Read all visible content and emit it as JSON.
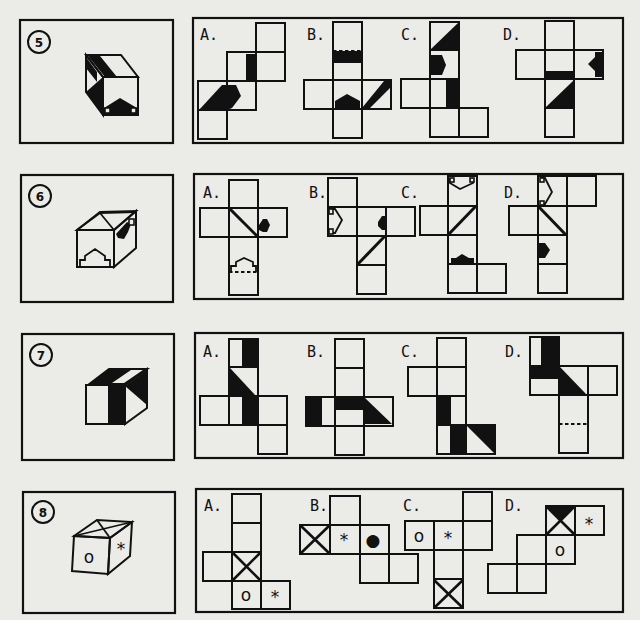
{
  "page": {
    "type": "cube-net-puzzle-sheet",
    "background": "#ebebe8",
    "ink": "#111111"
  },
  "problems": [
    {
      "number": "5",
      "cube": {
        "description": "cube with black diagonal stripe on top/left, black arrow pointing up on front face"
      },
      "options": [
        {
          "label": "A."
        },
        {
          "label": "B."
        },
        {
          "label": "C."
        },
        {
          "label": "D."
        }
      ]
    },
    {
      "number": "6",
      "cube": {
        "description": "cube with white house/arrow on front, triangle roof lines on top, black arrow on right face"
      },
      "options": [
        {
          "label": "A."
        },
        {
          "label": "B."
        },
        {
          "label": "C."
        },
        {
          "label": "D."
        }
      ]
    },
    {
      "number": "7",
      "cube": {
        "description": "cube with black top and vertical stripe on front, black triangle on right face"
      },
      "options": [
        {
          "label": "A."
        },
        {
          "label": "B."
        },
        {
          "label": "C."
        },
        {
          "label": "D."
        }
      ]
    },
    {
      "number": "8",
      "cube": {
        "description": "cube with X on top, circle on front, asterisk on right",
        "symbols": {
          "front": "o",
          "right": "*"
        }
      },
      "options": [
        {
          "label": "A.",
          "symbols": [
            "o",
            "*"
          ]
        },
        {
          "label": "B.",
          "symbols": [
            "*",
            "●"
          ]
        },
        {
          "label": "C.",
          "symbols": [
            "o",
            "*"
          ]
        },
        {
          "label": "D.",
          "symbols": [
            "*",
            "o"
          ]
        }
      ]
    }
  ]
}
